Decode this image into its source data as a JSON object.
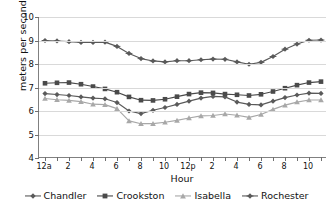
{
  "chart_data": {
    "type": "line",
    "title": "",
    "xlabel": "Hour",
    "ylabel": "meters per second",
    "ylim": [
      4,
      10
    ],
    "ytick_values": [
      4,
      5,
      6,
      7,
      8,
      9,
      10
    ],
    "ytick_labels": [
      "4",
      "5",
      "6",
      "7",
      "8",
      "9",
      "10"
    ],
    "grid": true,
    "legend_position": "bottom",
    "x": [
      0,
      1,
      2,
      3,
      4,
      5,
      6,
      7,
      8,
      9,
      10,
      11,
      12,
      13,
      14,
      15,
      16,
      17,
      18,
      19,
      20,
      21,
      22,
      23
    ],
    "categories": [
      "12a",
      "1",
      "2",
      "3",
      "4",
      "5",
      "6",
      "7",
      "8",
      "9",
      "10",
      "11",
      "12p",
      "1",
      "2",
      "3",
      "4",
      "5",
      "6",
      "7",
      "8",
      "9",
      "10",
      "11"
    ],
    "xtick_labels": [
      "12a",
      "",
      "2",
      "",
      "4",
      "",
      "6",
      "",
      "8",
      "",
      "10",
      "",
      "12p",
      "",
      "2",
      "",
      "4",
      "",
      "6",
      "",
      "8",
      "",
      "10",
      ""
    ],
    "series": [
      {
        "name": "Chandler",
        "color": "#5a5a5a",
        "marker": "diamond",
        "values": [
          6.74,
          6.7,
          6.66,
          6.6,
          6.55,
          6.52,
          6.36,
          6.0,
          5.89,
          6.03,
          6.15,
          6.28,
          6.42,
          6.55,
          6.62,
          6.6,
          6.38,
          6.28,
          6.26,
          6.42,
          6.57,
          6.68,
          6.76,
          6.75
        ]
      },
      {
        "name": "Crookston",
        "color": "#4a4a4a",
        "marker": "square",
        "values": [
          7.18,
          7.2,
          7.21,
          7.14,
          7.04,
          6.94,
          6.8,
          6.6,
          6.46,
          6.45,
          6.5,
          6.61,
          6.72,
          6.78,
          6.77,
          6.72,
          6.69,
          6.66,
          6.71,
          6.83,
          6.97,
          7.1,
          7.21,
          7.25
        ]
      },
      {
        "name": "Isabella",
        "color": "#a8a8a8",
        "marker": "triangle",
        "values": [
          6.53,
          6.48,
          6.45,
          6.4,
          6.29,
          6.27,
          6.1,
          5.58,
          5.46,
          5.46,
          5.52,
          5.6,
          5.7,
          5.79,
          5.81,
          5.87,
          5.82,
          5.73,
          5.85,
          6.07,
          6.25,
          6.38,
          6.47,
          6.47
        ]
      },
      {
        "name": "Rochester",
        "color": "#5a5a5a",
        "marker": "diamond-plus",
        "values": [
          9.0,
          8.98,
          8.95,
          8.92,
          8.92,
          8.93,
          8.75,
          8.45,
          8.23,
          8.13,
          8.09,
          8.14,
          8.14,
          8.18,
          8.21,
          8.2,
          8.09,
          7.99,
          8.07,
          8.32,
          8.63,
          8.85,
          9.01,
          9.02
        ]
      }
    ]
  },
  "legend": {
    "items": [
      {
        "label": "Chandler"
      },
      {
        "label": "Crookston"
      },
      {
        "label": "Isabella"
      },
      {
        "label": "Rochester"
      }
    ]
  },
  "axes": {
    "x_title": "Hour",
    "y_title": "meters per second"
  }
}
